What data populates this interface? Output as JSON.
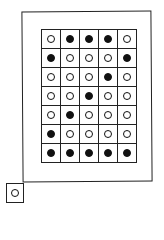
{
  "diagram": {
    "title": "",
    "rows": 7,
    "cols": 5,
    "colors": {
      "line": "#222222",
      "filled": "#111111",
      "empty": "#ffffff"
    },
    "matrix": [
      [
        0,
        1,
        1,
        1,
        0
      ],
      [
        1,
        0,
        0,
        0,
        1
      ],
      [
        0,
        0,
        0,
        1,
        0
      ],
      [
        0,
        0,
        1,
        0,
        0
      ],
      [
        0,
        1,
        0,
        0,
        0
      ],
      [
        1,
        0,
        0,
        0,
        0
      ],
      [
        1,
        1,
        1,
        1,
        1
      ]
    ],
    "indicator": {
      "state": "off"
    }
  }
}
